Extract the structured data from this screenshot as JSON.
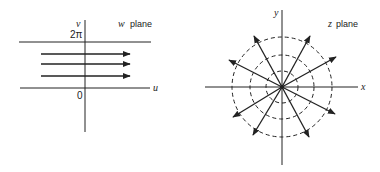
{
  "w_plane": {
    "title_var": "w",
    "title_word": "plane",
    "vertical_axis_label": "v",
    "horizontal_axis_label": "u",
    "top_line_label": "2π",
    "origin_label": "0",
    "arrow_count": 3,
    "description": "Horizontal strip 0 ≤ v ≤ 2π with three rightward-pointing arrows"
  },
  "z_plane": {
    "title_var": "z",
    "title_word": "plane",
    "horizontal_axis_label": "x",
    "vertical_axis_label": "y",
    "dashed_circle_count": 3,
    "ray_count": 10,
    "description": "Concentric dashed circles centered at origin with radial arrows emanating outward"
  },
  "colors": {
    "stroke": "#222222",
    "background": "#ffffff"
  }
}
